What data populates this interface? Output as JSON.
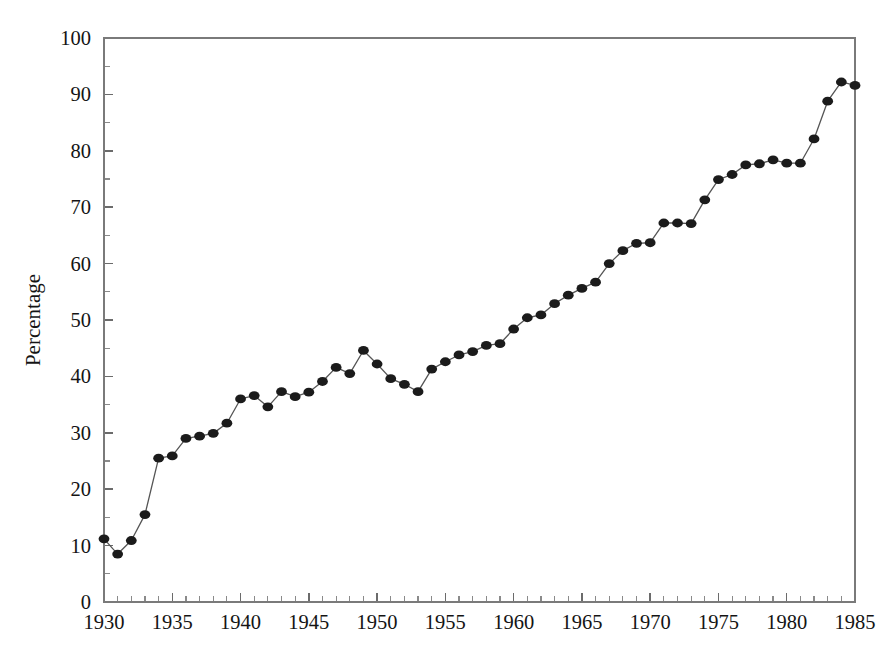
{
  "chart_data": {
    "type": "line",
    "title": "",
    "subtitle": "",
    "xlabel": "",
    "ylabel": "Percentage",
    "xlim": [
      1930,
      1985
    ],
    "ylim": [
      0,
      100
    ],
    "grid": false,
    "legend": false,
    "legend_position": "none",
    "marker": "filled-circle",
    "marker_color": "#1b1b1b",
    "line_color": "#555555",
    "x_tick_labels": [
      "1930",
      "1935",
      "1940",
      "1945",
      "1950",
      "1955",
      "1960",
      "1965",
      "1970",
      "1975",
      "1980",
      "1985"
    ],
    "x_major_ticks": [
      1930,
      1935,
      1940,
      1945,
      1950,
      1955,
      1960,
      1965,
      1970,
      1975,
      1980,
      1985
    ],
    "x_minor_tick_step": 1,
    "y_tick_labels": [
      "0",
      "10",
      "20",
      "30",
      "40",
      "50",
      "60",
      "70",
      "80",
      "90",
      "100"
    ],
    "y_major_ticks": [
      0,
      10,
      20,
      30,
      40,
      50,
      60,
      70,
      80,
      90,
      100
    ],
    "y_minor_ticks": [
      5,
      15,
      25,
      35,
      45,
      55,
      65,
      75,
      85,
      95
    ],
    "x": [
      1930,
      1931,
      1932,
      1933,
      1934,
      1935,
      1936,
      1937,
      1938,
      1939,
      1940,
      1941,
      1942,
      1943,
      1944,
      1945,
      1946,
      1947,
      1948,
      1949,
      1950,
      1951,
      1952,
      1953,
      1954,
      1955,
      1956,
      1957,
      1958,
      1959,
      1960,
      1961,
      1962,
      1963,
      1964,
      1965,
      1966,
      1967,
      1968,
      1969,
      1970,
      1971,
      1972,
      1973,
      1974,
      1975,
      1976,
      1977,
      1978,
      1979,
      1980,
      1981,
      1982,
      1983,
      1984,
      1985
    ],
    "values": [
      11.2,
      8.5,
      10.9,
      15.5,
      25.5,
      25.9,
      29.0,
      29.4,
      29.9,
      31.7,
      36.0,
      36.6,
      34.6,
      37.3,
      36.4,
      37.2,
      39.1,
      41.6,
      40.5,
      44.6,
      42.2,
      39.6,
      38.6,
      37.3,
      41.3,
      42.6,
      43.8,
      44.4,
      45.5,
      45.8,
      48.4,
      50.4,
      50.9,
      52.9,
      54.4,
      55.6,
      56.7,
      60.0,
      62.3,
      63.6,
      63.7,
      67.2,
      67.2,
      67.1,
      71.3,
      74.9,
      75.8,
      77.5,
      77.7,
      78.4,
      77.8,
      77.8,
      82.1,
      88.8,
      92.2,
      91.6
    ],
    "point_count": 56
  }
}
